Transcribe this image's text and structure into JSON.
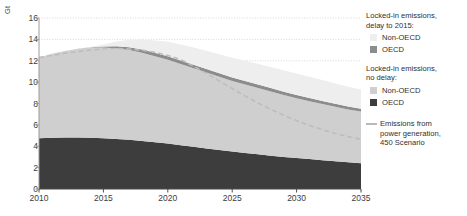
{
  "chart_data": {
    "type": "area",
    "title": "",
    "subtitle": "",
    "xlabel": "",
    "ylabel": "Gt",
    "unit": "Gt",
    "xlim": [
      2010,
      2035
    ],
    "ylim": [
      0,
      16
    ],
    "ytick_values": [
      0,
      2,
      4,
      6,
      8,
      10,
      12,
      14,
      16
    ],
    "ytick_labels": [
      "0",
      "2",
      "4",
      "6",
      "8",
      "10",
      "12",
      "14",
      "16"
    ],
    "xtick_values": [
      2010,
      2015,
      2020,
      2025,
      2030,
      2035
    ],
    "xtick_labels": [
      "2010",
      "2015",
      "2020",
      "2025",
      "2030",
      "2035"
    ],
    "grid": "horizontal-dotted",
    "grid_values": [
      12,
      14,
      16
    ],
    "legend_position": "right",
    "x": [
      2010,
      2011,
      2012,
      2013,
      2014,
      2015,
      2016,
      2017,
      2018,
      2019,
      2020,
      2021,
      2022,
      2023,
      2024,
      2025,
      2026,
      2027,
      2028,
      2029,
      2030,
      2031,
      2032,
      2033,
      2034,
      2035
    ],
    "series": [
      {
        "name": "OECD",
        "scenario": "Locked-in emissions, no delay",
        "stack": "no-delay",
        "stack_order": 1,
        "color": "#3d3d3d",
        "values": [
          4.75,
          4.8,
          4.82,
          4.82,
          4.8,
          4.75,
          4.68,
          4.6,
          4.5,
          4.38,
          4.25,
          4.1,
          3.95,
          3.8,
          3.65,
          3.5,
          3.38,
          3.25,
          3.12,
          3.0,
          2.9,
          2.8,
          2.7,
          2.6,
          2.5,
          2.42
        ]
      },
      {
        "name": "Non-OECD",
        "scenario": "Locked-in emissions, no delay",
        "stack": "no-delay",
        "stack_order": 2,
        "color": "#cfcfcf",
        "values": [
          7.55,
          7.85,
          8.1,
          8.3,
          8.45,
          8.5,
          8.5,
          8.4,
          8.25,
          8.05,
          7.85,
          7.6,
          7.35,
          7.1,
          6.85,
          6.6,
          6.4,
          6.2,
          6.0,
          5.8,
          5.6,
          5.42,
          5.25,
          5.1,
          4.95,
          4.83
        ]
      },
      {
        "name": "OECD",
        "scenario": "Locked-in emissions, delay to 2015",
        "stack": "delay",
        "stack_order": 3,
        "color": "#8c8c8c",
        "values": [
          0.0,
          0.0,
          0.0,
          0.0,
          0.02,
          0.08,
          0.18,
          0.26,
          0.3,
          0.32,
          0.33,
          0.33,
          0.33,
          0.33,
          0.33,
          0.33,
          0.33,
          0.32,
          0.32,
          0.31,
          0.3,
          0.3,
          0.29,
          0.28,
          0.27,
          0.26
        ]
      },
      {
        "name": "Non-OECD",
        "scenario": "Locked-in emissions, delay to 2015",
        "stack": "delay",
        "stack_order": 4,
        "color": "#eeeeee",
        "values": [
          0.0,
          0.0,
          0.0,
          0.0,
          0.05,
          0.2,
          0.45,
          0.7,
          0.95,
          1.15,
          1.35,
          1.5,
          1.62,
          1.7,
          1.78,
          1.85,
          1.9,
          1.95,
          1.98,
          2.0,
          2.0,
          1.98,
          1.95,
          1.9,
          1.85,
          1.8
        ]
      }
    ],
    "lines": [
      {
        "name": "Emissions from power generation, 450 Scenario",
        "style": "dashed",
        "color": "#bdbdbd",
        "values": [
          12.3,
          12.5,
          12.7,
          12.85,
          13.0,
          13.1,
          13.15,
          13.1,
          13.0,
          12.8,
          12.5,
          12.1,
          11.5,
          10.8,
          10.1,
          9.4,
          8.7,
          8.05,
          7.45,
          6.9,
          6.4,
          5.95,
          5.55,
          5.2,
          4.9,
          4.65
        ]
      }
    ]
  },
  "axis": {
    "unit_label": "Gt"
  },
  "legend": {
    "groups": [
      {
        "title_line1": "Locked-in emissions,",
        "title_line2": "delay to 2015:",
        "items": [
          {
            "label": "Non-OECD",
            "color": "#eeeeee",
            "type": "swatch"
          },
          {
            "label": "OECD",
            "color": "#8c8c8c",
            "type": "swatch"
          }
        ]
      },
      {
        "title_line1": "Locked-in emissions,",
        "title_line2": "no delay:",
        "items": [
          {
            "label": "Non-OECD",
            "color": "#cfcfcf",
            "type": "swatch"
          },
          {
            "label": "OECD",
            "color": "#3d3d3d",
            "type": "swatch"
          }
        ]
      }
    ],
    "line_item": {
      "label_line1": "Emissions from",
      "label_line2": "power generation,",
      "label_line3": "450 Scenario",
      "color": "#bdbdbd"
    }
  }
}
